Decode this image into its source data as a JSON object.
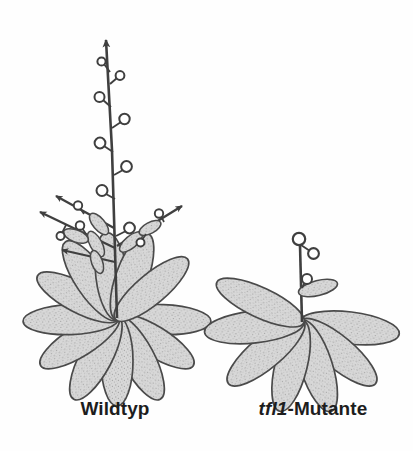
{
  "figure": {
    "type": "botanical-comparison-diagram",
    "background_color": "#fefefe",
    "ink_color": "#3f3f3f",
    "leaf_fill_color": "#d2d2d2",
    "leaf_outline_color": "#4a4a4a",
    "text_color": "#1d1d1d"
  },
  "panels": [
    {
      "id": "wildtype",
      "caption": "Wildtyp",
      "caption_gene_part": "",
      "caption_rest": "Wildtyp",
      "growth_habit": "indeterminate",
      "apex_marker": "arrowhead",
      "rosette_leaf_count": 12,
      "lateral_branch_count": 4,
      "flower_bud_count_main_stem": 8,
      "main_stem_height_px": 260
    },
    {
      "id": "tfl1-mutant",
      "caption": "tfl1-Mutante",
      "caption_gene_part": "tfl1",
      "caption_rest": "-Mutante",
      "growth_habit": "determinate",
      "apex_marker": "terminal-flower",
      "rosette_leaf_count": 7,
      "lateral_branch_count": 0,
      "flower_bud_count_main_stem": 3,
      "main_stem_height_px": 100
    }
  ],
  "labels": {
    "wildtype": "Wildtyp",
    "mutant_gene": "tfl1",
    "mutant_suffix": "-Mutante"
  }
}
